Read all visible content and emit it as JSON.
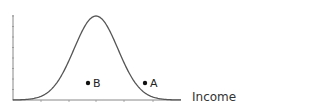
{
  "chart_data": {
    "type": "line",
    "title": "",
    "xlabel": "Income",
    "ylabel": "",
    "grid": false,
    "legend": null,
    "series": [
      {
        "name": "distribution",
        "shape": "normal",
        "peak_x_fraction": 0.5,
        "x": [
          0,
          0.1,
          0.2,
          0.3,
          0.4,
          0.5,
          0.6,
          0.7,
          0.8,
          0.9,
          1.0
        ],
        "values": [
          0.01,
          0.04,
          0.14,
          0.37,
          0.75,
          1.0,
          0.75,
          0.37,
          0.14,
          0.04,
          0.01
        ]
      }
    ],
    "points": [
      {
        "label": "B",
        "x_fraction": 0.45,
        "y_fraction": 0.17,
        "on_curve": false
      },
      {
        "label": "A",
        "x_fraction": 0.78,
        "y_fraction": 0.17,
        "on_curve": true
      }
    ],
    "x_ticks_count": 5,
    "y_ticks_count": 8
  },
  "axis": {
    "x_label": "Income"
  },
  "points": {
    "a_label": "A",
    "b_label": "B"
  },
  "colors": {
    "curve": "#555555",
    "axis": "#888888",
    "point": "#111111"
  }
}
